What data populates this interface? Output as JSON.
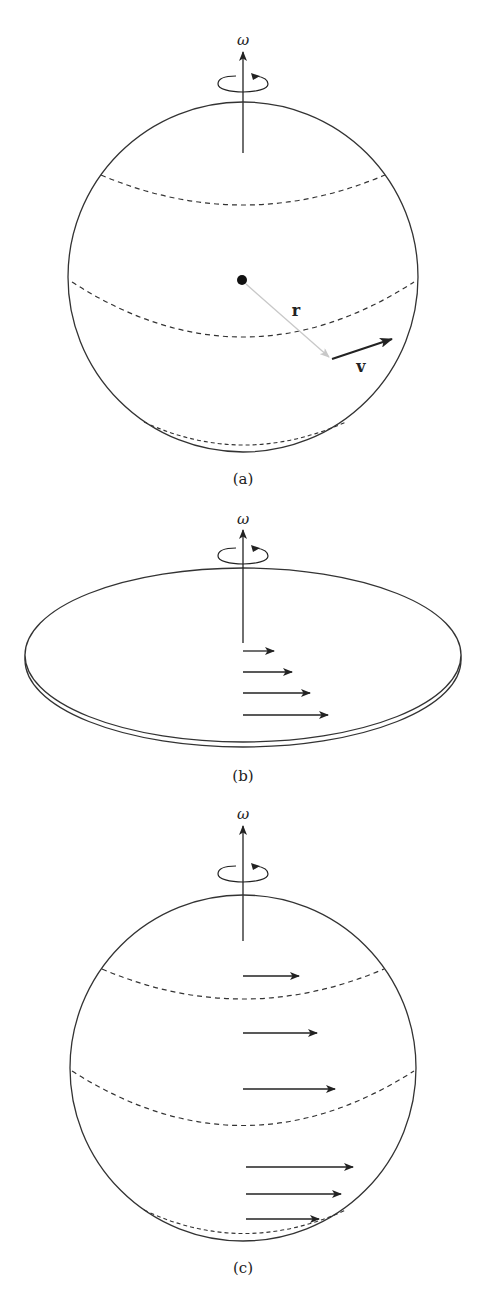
{
  "figure": {
    "panels": [
      {
        "id": "a",
        "caption": "(a)",
        "axis_label": "ω",
        "radius_label": "r",
        "velocity_label": "v",
        "description": "Rotating sphere with position vector r from center and tangential velocity v"
      },
      {
        "id": "b",
        "caption": "(b)",
        "axis_label": "ω",
        "description": "Rotating disk with velocity arrows increasing with distance from axis",
        "arrow_count": 4
      },
      {
        "id": "c",
        "caption": "(c)",
        "axis_label": "ω",
        "description": "Rotating sphere with velocity arrows at various latitudes",
        "arrow_count": 6
      }
    ],
    "colors": {
      "line": "#333333",
      "radius_vector": "#bbbbbb",
      "background": "#ffffff"
    }
  }
}
